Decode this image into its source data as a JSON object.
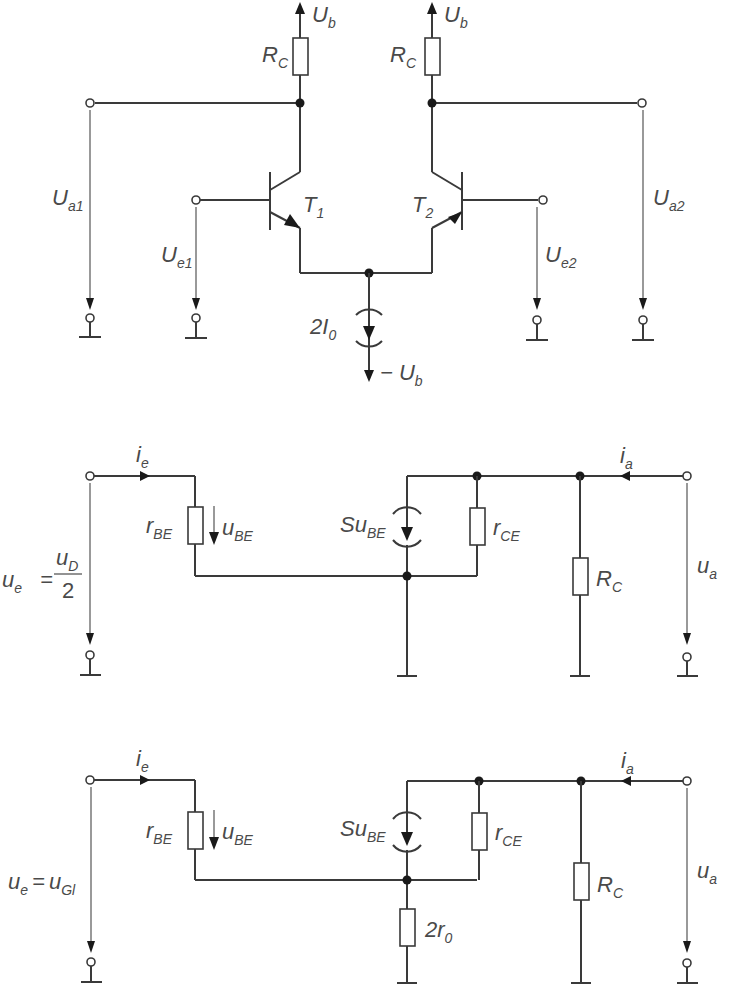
{
  "diagram": {
    "type": "circuit-schematics",
    "circuits": [
      {
        "id": "differential-amplifier",
        "labels": {
          "supply_pos_left": {
            "main": "U",
            "sub": "b"
          },
          "supply_pos_right": {
            "main": "U",
            "sub": "b"
          },
          "rc_left": {
            "main": "R",
            "sub": "C"
          },
          "rc_right": {
            "main": "R",
            "sub": "C"
          },
          "t1": {
            "main": "T",
            "sub": "1"
          },
          "t2": {
            "main": "T",
            "sub": "2"
          },
          "ua1": {
            "main": "U",
            "sub": "a1"
          },
          "ua2": {
            "main": "U",
            "sub": "a2"
          },
          "ue1": {
            "main": "U",
            "sub": "e1"
          },
          "ue2": {
            "main": "U",
            "sub": "e2"
          },
          "current_source": {
            "prefix": "2",
            "main": "I",
            "sub": "0"
          },
          "supply_neg": {
            "prefix": "− ",
            "main": "U",
            "sub": "b"
          }
        }
      },
      {
        "id": "small-signal-differential-mode",
        "labels": {
          "ie": {
            "main": "i",
            "sub": "e"
          },
          "rbe": {
            "main": "r",
            "sub": "BE"
          },
          "ube": {
            "main": "u",
            "sub": "BE"
          },
          "source": {
            "main": "Su",
            "sub": "BE"
          },
          "rce": {
            "main": "r",
            "sub": "CE"
          },
          "rc": {
            "main": "R",
            "sub": "C"
          },
          "ia": {
            "main": "i",
            "sub": "a"
          },
          "ua": {
            "main": "u",
            "sub": "a"
          },
          "ue": {
            "main": "u",
            "sub": "e",
            "eq": "=",
            "num_main": "u",
            "num_sub": "D",
            "den": "2"
          }
        }
      },
      {
        "id": "small-signal-common-mode",
        "labels": {
          "ie": {
            "main": "i",
            "sub": "e"
          },
          "rbe": {
            "main": "r",
            "sub": "BE"
          },
          "ube": {
            "main": "u",
            "sub": "BE"
          },
          "source": {
            "main": "Su",
            "sub": "BE"
          },
          "rce": {
            "main": "r",
            "sub": "CE"
          },
          "rc": {
            "main": "R",
            "sub": "C"
          },
          "ia": {
            "main": "i",
            "sub": "a"
          },
          "ua": {
            "main": "u",
            "sub": "a"
          },
          "r0": {
            "prefix": "2",
            "main": "r",
            "sub": "0"
          },
          "ue": {
            "main": "u",
            "sub": "e",
            "eq": "=",
            "rhs_main": "u",
            "rhs_sub": "Gl"
          }
        }
      }
    ],
    "colors": {
      "line": "#3a3a3a",
      "label": "#4a4a4a",
      "background": "#ffffff"
    }
  }
}
